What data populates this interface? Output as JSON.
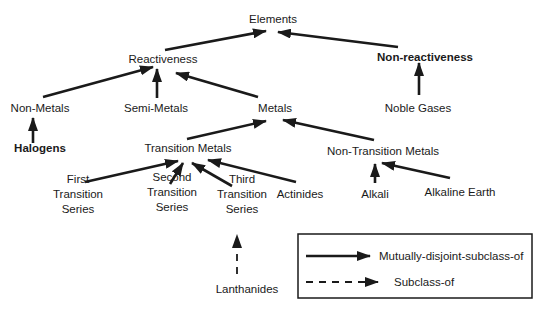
{
  "diagram": {
    "type": "class-hierarchy",
    "colors": {
      "ink": "#1a1a1a",
      "background": "#ffffff"
    },
    "nodes": [
      {
        "id": "elements",
        "label": [
          "Elements"
        ],
        "x": 273,
        "y": 23,
        "bold": false
      },
      {
        "id": "reactiveness",
        "label": [
          "Reactiveness"
        ],
        "x": 163,
        "y": 63,
        "bold": false
      },
      {
        "id": "non-reactiveness",
        "label": [
          "Non-reactiveness"
        ],
        "x": 425,
        "y": 61,
        "bold": true
      },
      {
        "id": "non-metals",
        "label": [
          "Non-Metals"
        ],
        "x": 40,
        "y": 112,
        "bold": false
      },
      {
        "id": "semi-metals",
        "label": [
          "Semi-Metals"
        ],
        "x": 156,
        "y": 112,
        "bold": false
      },
      {
        "id": "metals",
        "label": [
          "Metals"
        ],
        "x": 275,
        "y": 112,
        "bold": false
      },
      {
        "id": "noble-gases",
        "label": [
          "Noble Gases"
        ],
        "x": 418,
        "y": 112,
        "bold": false
      },
      {
        "id": "halogens",
        "label": [
          "Halogens"
        ],
        "x": 40,
        "y": 152,
        "bold": true
      },
      {
        "id": "transition-metals",
        "label": [
          "Transition Metals"
        ],
        "x": 188,
        "y": 152,
        "bold": false
      },
      {
        "id": "non-transition-metals",
        "label": [
          "Non-Transition Metals"
        ],
        "x": 383,
        "y": 155,
        "bold": false
      },
      {
        "id": "first-transition-series",
        "label": [
          "First",
          "Transition",
          "Series"
        ],
        "x": 78,
        "y": 198,
        "bold": false
      },
      {
        "id": "second-transition-series",
        "label": [
          "Second",
          "Transition",
          "Series"
        ],
        "x": 172,
        "y": 196,
        "bold": false
      },
      {
        "id": "third-transition-series",
        "label": [
          "Third",
          "Transition",
          "Series"
        ],
        "x": 242,
        "y": 198,
        "bold": false
      },
      {
        "id": "actinides",
        "label": [
          "Actinides"
        ],
        "x": 300,
        "y": 198,
        "bold": false
      },
      {
        "id": "alkali",
        "label": [
          "Alkali"
        ],
        "x": 375,
        "y": 198,
        "bold": false
      },
      {
        "id": "alkaline-earth",
        "label": [
          "Alkaline Earth"
        ],
        "x": 460,
        "y": 196,
        "bold": false
      },
      {
        "id": "lanthanides",
        "label": [
          "Lanthanides"
        ],
        "x": 247,
        "y": 293,
        "bold": false
      }
    ],
    "edges": [
      {
        "from": "reactiveness",
        "to": "elements",
        "type": "mutually-disjoint-subclass-of",
        "x1": 165,
        "y1": 50,
        "x2": 266,
        "y2": 31
      },
      {
        "from": "non-reactiveness",
        "to": "elements",
        "type": "mutually-disjoint-subclass-of",
        "x1": 398,
        "y1": 47,
        "x2": 278,
        "y2": 32
      },
      {
        "from": "non-metals",
        "to": "reactiveness",
        "type": "mutually-disjoint-subclass-of",
        "x1": 43,
        "y1": 97,
        "x2": 153,
        "y2": 67
      },
      {
        "from": "semi-metals",
        "to": "reactiveness",
        "type": "mutually-disjoint-subclass-of",
        "x1": 157,
        "y1": 98,
        "x2": 157,
        "y2": 69
      },
      {
        "from": "metals",
        "to": "reactiveness",
        "type": "mutually-disjoint-subclass-of",
        "x1": 258,
        "y1": 97,
        "x2": 176,
        "y2": 73
      },
      {
        "from": "noble-gases",
        "to": "non-reactiveness",
        "type": "mutually-disjoint-subclass-of",
        "x1": 419,
        "y1": 95,
        "x2": 419,
        "y2": 63
      },
      {
        "from": "halogens",
        "to": "non-metals",
        "type": "mutually-disjoint-subclass-of",
        "x1": 33,
        "y1": 143,
        "x2": 33,
        "y2": 118
      },
      {
        "from": "transition-metals",
        "to": "metals",
        "type": "mutually-disjoint-subclass-of",
        "x1": 187,
        "y1": 139,
        "x2": 266,
        "y2": 121
      },
      {
        "from": "non-transition-metals",
        "to": "metals",
        "type": "mutually-disjoint-subclass-of",
        "x1": 374,
        "y1": 140,
        "x2": 283,
        "y2": 120
      },
      {
        "from": "first-transition-series",
        "to": "transition-metals",
        "type": "mutually-disjoint-subclass-of",
        "x1": 85,
        "y1": 182,
        "x2": 178,
        "y2": 161
      },
      {
        "from": "second-transition-series",
        "to": "transition-metals",
        "type": "mutually-disjoint-subclass-of",
        "x1": 170,
        "y1": 184,
        "x2": 183,
        "y2": 163
      },
      {
        "from": "third-transition-series",
        "to": "transition-metals",
        "type": "mutually-disjoint-subclass-of",
        "x1": 232,
        "y1": 186,
        "x2": 192,
        "y2": 163
      },
      {
        "from": "actinides",
        "to": "transition-metals",
        "type": "mutually-disjoint-subclass-of",
        "x1": 296,
        "y1": 182,
        "x2": 208,
        "y2": 160
      },
      {
        "from": "alkali",
        "to": "non-transition-metals",
        "type": "mutually-disjoint-subclass-of",
        "x1": 375,
        "y1": 183,
        "x2": 375,
        "y2": 164
      },
      {
        "from": "alkaline-earth",
        "to": "non-transition-metals",
        "type": "mutually-disjoint-subclass-of",
        "x1": 450,
        "y1": 178,
        "x2": 382,
        "y2": 163
      },
      {
        "from": "lanthanides",
        "to": "third-transition-series",
        "type": "subclass-of",
        "x1": 237,
        "y1": 274,
        "x2": 237,
        "y2": 235
      }
    ]
  },
  "legend": {
    "box": {
      "x": 298,
      "y": 234,
      "width": 234,
      "height": 64
    },
    "items": [
      {
        "label": "Mutually-disjoint-subclass-of",
        "style": "solid",
        "line_x1": 306,
        "line_x2": 370,
        "y": 256,
        "text_x": 379
      },
      {
        "label": "Subclass-of",
        "style": "dashed",
        "line_x1": 306,
        "line_x2": 378,
        "y": 282,
        "text_x": 394
      }
    ]
  }
}
